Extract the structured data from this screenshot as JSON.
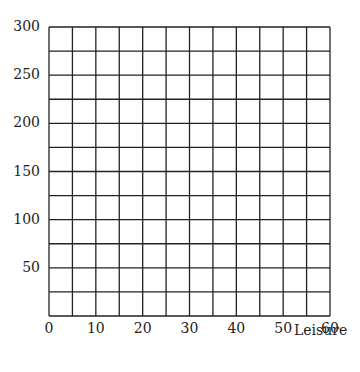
{
  "chart_data": {
    "type": "line",
    "title": "",
    "xlabel": "Leisure",
    "ylabel": "",
    "xlim": [
      0,
      60
    ],
    "ylim": [
      0,
      300
    ],
    "x_ticks": [
      "0",
      "10",
      "20",
      "30",
      "40",
      "50",
      "60"
    ],
    "y_ticks": [
      "50",
      "100",
      "150",
      "200",
      "250",
      "300"
    ],
    "grid": true,
    "grid_x_step": 5,
    "grid_y_step": 25,
    "series": []
  },
  "labels": {
    "x_title": "Leisure"
  }
}
